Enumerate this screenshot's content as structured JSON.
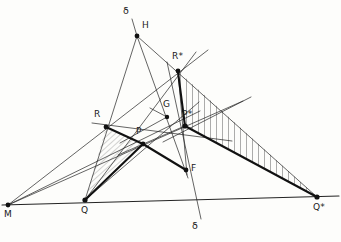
{
  "figure": {
    "background_color": "#fdfdfb",
    "ink_color": "#1a1a1a",
    "hatch_color": "#5a5a5a",
    "canvas": {
      "width": 341,
      "height": 242
    }
  },
  "points": [
    {
      "id": "H",
      "label": "H",
      "x": 137,
      "y": 36,
      "dot": true,
      "label_dx": 6,
      "label_dy": -13
    },
    {
      "id": "Rstar",
      "label": "R*",
      "x": 178,
      "y": 71,
      "dot": true,
      "label_dx": -1,
      "label_dy": -17
    },
    {
      "id": "R",
      "label": "R",
      "x": 106,
      "y": 127,
      "dot": true,
      "label_dx": -10,
      "label_dy": -15
    },
    {
      "id": "P",
      "label": "P",
      "x": 143,
      "y": 144,
      "dot": true,
      "label_dx": -3,
      "label_dy": -15
    },
    {
      "id": "G",
      "label": "G",
      "x": 167,
      "y": 117,
      "dot": true,
      "label_dx": -2,
      "label_dy": -15
    },
    {
      "id": "Pstar",
      "label": "P*",
      "x": 185,
      "y": 126,
      "dot": true,
      "label_dx": -1,
      "label_dy": -14
    },
    {
      "id": "F",
      "label": "F",
      "x": 186,
      "y": 170,
      "dot": true,
      "label_dx": 5,
      "label_dy": -4
    },
    {
      "id": "M",
      "label": "M",
      "x": 8,
      "y": 205,
      "dot": true,
      "label_dx": -4,
      "label_dy": 6
    },
    {
      "id": "Q",
      "label": "Q",
      "x": 85,
      "y": 200,
      "dot": true,
      "label_dx": -4,
      "label_dy": 7
    },
    {
      "id": "Qstar",
      "label": "Q*",
      "x": 317,
      "y": 197,
      "dot": true,
      "label_dx": -1,
      "label_dy": 7
    }
  ],
  "axis_labels": [
    {
      "id": "delta_top",
      "label": "δ",
      "x": 126,
      "y": 14
    },
    {
      "id": "delta_bottom",
      "label": "δ",
      "x": 195,
      "y": 226
    }
  ],
  "segments": {
    "thick": [
      {
        "id": "seg-Rstar-Pstar",
        "from": "Rstar",
        "to": "Pstar"
      },
      {
        "id": "seg-Pstar-Qstar",
        "from": "Pstar",
        "to": "Qstar"
      },
      {
        "id": "seg-R-P",
        "from": "R",
        "to": "P"
      },
      {
        "id": "seg-P-Q",
        "from": "P",
        "to": "Q"
      },
      {
        "id": "seg-Q-R",
        "from": "Q",
        "to": "R"
      },
      {
        "id": "seg-P-F",
        "from": "P",
        "to": "F"
      }
    ],
    "thin": [
      {
        "id": "line-delta-top-H",
        "x1": 132,
        "y1": 19,
        "x2": 137,
        "y2": 36
      },
      {
        "id": "line-H-Q",
        "x1": 137,
        "y1": 36,
        "x2": 85,
        "y2": 200
      },
      {
        "id": "line-H-F",
        "x1": 137,
        "y1": 36,
        "x2": 188,
        "y2": 178
      },
      {
        "id": "line-H-Qstar",
        "x1": 137,
        "y1": 36,
        "x2": 317,
        "y2": 197
      },
      {
        "id": "line-M-Rstar-ext",
        "x1": 8,
        "y1": 205,
        "x2": 208,
        "y2": 50
      },
      {
        "id": "line-M-Pstar-ext",
        "x1": 8,
        "y1": 205,
        "x2": 243,
        "y2": 101
      },
      {
        "id": "line-M-G-ext",
        "x1": 8,
        "y1": 205,
        "x2": 200,
        "y2": 111
      },
      {
        "id": "line-M-Qstar-base",
        "x1": 2,
        "y1": 205,
        "x2": 339,
        "y2": 196
      },
      {
        "id": "line-Q-Rstar-ext",
        "x1": 85,
        "y1": 200,
        "x2": 196,
        "y2": 52
      },
      {
        "id": "line-Q-G-ext",
        "x1": 85,
        "y1": 200,
        "x2": 199,
        "y2": 102
      },
      {
        "id": "line-R-Pstar-ext",
        "x1": 96,
        "y1": 124,
        "x2": 228,
        "y2": 140
      },
      {
        "id": "line-R-G-ext",
        "x1": 100,
        "y1": 130,
        "x2": 200,
        "y2": 100
      },
      {
        "id": "line-delta-through",
        "x1": 167,
        "y1": 62,
        "x2": 201,
        "y2": 219
      },
      {
        "id": "line-Rstar-down",
        "x1": 178,
        "y1": 71,
        "x2": 186,
        "y2": 170
      },
      {
        "id": "line-Pstar-upright",
        "x1": 168,
        "y1": 139,
        "x2": 251,
        "y2": 97
      },
      {
        "id": "line-P-upright",
        "x1": 124,
        "y1": 152,
        "x2": 185,
        "y2": 126
      }
    ]
  },
  "shaded_regions": [
    {
      "id": "hatch-small-triangle",
      "vertices": [
        "R",
        "P",
        "Q"
      ],
      "hatch_style": "diagonal",
      "hatch_angle_deg": 45,
      "hatch_spacing_px": 4
    },
    {
      "id": "hatch-large-triangle",
      "vertices": [
        "Rstar",
        "Pstar",
        "Qstar"
      ],
      "hatch_style": "vertical",
      "hatch_angle_deg": 90,
      "hatch_spacing_px": 6
    }
  ]
}
